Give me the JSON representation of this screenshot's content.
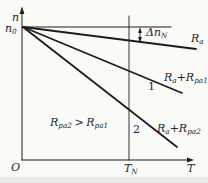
{
  "palette": {
    "bg": "#fafaf7",
    "ink": "#26262a",
    "line": "#1d1d20",
    "scan_shadow": "#b9b9b3"
  },
  "figure": {
    "width": 208,
    "height": 183,
    "lines": [
      {
        "id": "y-axis",
        "x1": 22,
        "y1": 160,
        "x2": 22,
        "y2": 12,
        "w": 1.0
      },
      {
        "id": "x-axis",
        "x1": 22,
        "y1": 160,
        "x2": 189,
        "y2": 160,
        "w": 1.0
      },
      {
        "id": "n0-level-line",
        "x1": 23,
        "y1": 27,
        "x2": 171,
        "y2": 27,
        "w": 1.1
      },
      {
        "id": "ra-line",
        "x1": 23,
        "y1": 27,
        "x2": 196,
        "y2": 49,
        "w": 1.8
      },
      {
        "id": "ra-rpa1-line",
        "x1": 23,
        "y1": 27,
        "x2": 182,
        "y2": 93,
        "w": 1.8
      },
      {
        "id": "ra-rpa2-line",
        "x1": 23,
        "y1": 27,
        "x2": 177,
        "y2": 147,
        "w": 1.8
      },
      {
        "id": "tn-vertical-line",
        "x1": 129,
        "y1": 16,
        "x2": 129,
        "y2": 160,
        "w": 0.9
      },
      {
        "id": "delta-arrow-shaft",
        "x1": 140,
        "y1": 29,
        "x2": 140,
        "y2": 41,
        "w": 0.9
      }
    ],
    "arrowheads": [
      {
        "id": "y-axis-arrowhead",
        "points": "22,6.5 19.6,14 24.4,14"
      },
      {
        "id": "x-axis-arrowhead",
        "points": "194,160 187,157.6 187,162.4"
      },
      {
        "id": "delta-top-arrowhead",
        "points": "140,27.6 138.1,33 141.9,33"
      },
      {
        "id": "delta-bottom-arrowhead",
        "points": "140,42.4 138.1,37 141.9,37"
      }
    ],
    "shadows": [
      {
        "id": "bottom-scan-shade",
        "x": 0,
        "y": 177,
        "w": 208,
        "h": 6,
        "opacity": 0.22
      }
    ],
    "labels": [
      {
        "id": "n-axis-label",
        "x": 12,
        "y": 21,
        "segs": [
          {
            "t": "n"
          }
        ]
      },
      {
        "id": "n0-label",
        "x": 5,
        "y": 32,
        "segs": [
          {
            "t": "n"
          },
          {
            "t": "0",
            "sub": true
          }
        ]
      },
      {
        "id": "delta-n-label",
        "x": 146,
        "y": 36,
        "segs": [
          {
            "t": "Δn"
          },
          {
            "t": "N",
            "sub": true
          }
        ]
      },
      {
        "id": "ra-label",
        "x": 191,
        "y": 42,
        "segs": [
          {
            "t": "R"
          },
          {
            "t": "a",
            "sub": true
          }
        ]
      },
      {
        "id": "ra-rpa1-label",
        "x": 164,
        "y": 81,
        "segs": [
          {
            "t": "R"
          },
          {
            "t": "a",
            "sub": true
          },
          {
            "t": "+R"
          },
          {
            "t": "pa1",
            "sub": true
          }
        ]
      },
      {
        "id": "curve1-label",
        "x": 148,
        "y": 90,
        "upright": true,
        "segs": [
          {
            "t": "1"
          }
        ]
      },
      {
        "id": "inequality-label",
        "x": 50,
        "y": 126,
        "segs": [
          {
            "t": "R"
          },
          {
            "t": "pa2",
            "sub": true
          },
          {
            "t": ">",
            "dx": 2.5
          },
          {
            "t": "R",
            "dx": 2.5
          },
          {
            "t": "pa1",
            "sub": true
          }
        ]
      },
      {
        "id": "curve2-label",
        "x": 133,
        "y": 133,
        "upright": true,
        "segs": [
          {
            "t": "2"
          }
        ]
      },
      {
        "id": "ra-rpa2-label",
        "x": 157,
        "y": 132,
        "segs": [
          {
            "t": "R"
          },
          {
            "t": "a",
            "sub": true
          },
          {
            "t": "+R"
          },
          {
            "t": "pa2",
            "sub": true
          }
        ]
      },
      {
        "id": "origin-label",
        "x": 11,
        "y": 171,
        "segs": [
          {
            "t": "O"
          }
        ]
      },
      {
        "id": "tn-label",
        "x": 124,
        "y": 172,
        "segs": [
          {
            "t": "T"
          },
          {
            "t": "N",
            "sub": true
          }
        ]
      },
      {
        "id": "t-axis-label",
        "x": 187,
        "y": 172,
        "segs": [
          {
            "t": "T"
          }
        ]
      }
    ]
  },
  "chart_data": {
    "type": "line",
    "xlabel": "T",
    "ylabel": "n",
    "grid": false,
    "legend_position": "inline-labels",
    "axis_style": "qualitative (no numeric ticks; arrows on axes)",
    "x_tick_labels": [
      "O",
      "T_N",
      "T"
    ],
    "y_tick_labels": [
      "n0"
    ],
    "units": "normalized: n0 = 1.0 at no-load; T axis 0..1 at arrow tip; T_N = 0.63",
    "x_range": [
      0,
      1.0
    ],
    "y_range": [
      0,
      1.0
    ],
    "series": [
      {
        "name": "n0 ideal no-load speed level",
        "x": [
          0,
          0.87
        ],
        "y": [
          1.0,
          1.0
        ]
      },
      {
        "name": "R_a (natural characteristic)",
        "x": [
          0,
          1.02
        ],
        "y": [
          1.0,
          0.84
        ]
      },
      {
        "name": "R_a+R_pa1 (curve 1)",
        "x": [
          0,
          0.94
        ],
        "y": [
          1.0,
          0.5
        ]
      },
      {
        "name": "R_a+R_pa2 (curve 2)",
        "x": [
          0,
          0.91
        ],
        "y": [
          1.0,
          0.1
        ]
      }
    ],
    "annotations": [
      {
        "text": "Δn_N",
        "meaning": "speed drop between n0 line and R_a line near T_N",
        "value_estimate": 0.1
      },
      {
        "text": "R_pa2 > R_pa1",
        "meaning": "inequality note inside plot area"
      },
      {
        "text": "1",
        "meaning": "number tag of R_a+R_pa1 line"
      },
      {
        "text": "2",
        "meaning": "number tag of R_a+R_pa2 line"
      },
      {
        "text": "vertical guide line at T = T_N from top to x-axis"
      }
    ]
  }
}
